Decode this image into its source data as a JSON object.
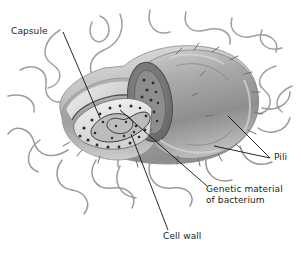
{
  "figure": {
    "subject": "bacterium",
    "background_color": "#ffffff",
    "width": 301,
    "height": 259
  },
  "labels": {
    "capsule": "Capsule",
    "pili": "Pili",
    "genetic_line1": "Genetic material",
    "genetic_line2": "of bacterium",
    "cell_wall": "Cell wall"
  },
  "colors": {
    "body_mid": "#9b9b9b",
    "body_light": "#c9c9c9",
    "body_dark": "#6e6e6e",
    "capsule": "#d8d8d8",
    "cytoplasm": "#e3e3e3",
    "nucleoid": "#b0b0b0",
    "ribosome": "#3a3a3a",
    "pili_stroke": "#9a9a9a",
    "leader_line": "#111111",
    "text": "#1c1c1c"
  },
  "parts": [
    {
      "name": "capsule",
      "description": "outer gelatinous layer surrounding the cell"
    },
    {
      "name": "cell-wall",
      "description": "rigid layer beneath the capsule"
    },
    {
      "name": "genetic-material",
      "description": "nucleoid region of looped DNA inside cytoplasm"
    },
    {
      "name": "pili",
      "description": "long hair-like filaments projecting from the surface"
    }
  ]
}
